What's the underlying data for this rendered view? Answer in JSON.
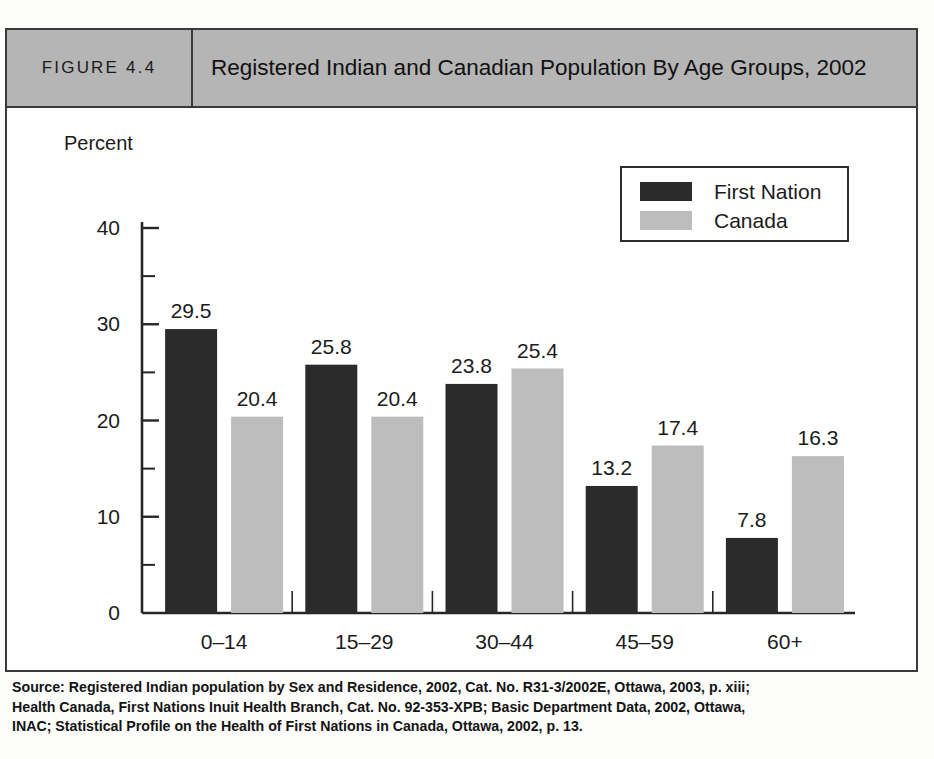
{
  "figure": {
    "number_label": "FIGURE 4.4",
    "title": "Registered Indian and Canadian Population By Age Groups, 2002"
  },
  "legend": {
    "items": [
      {
        "label": "First Nation",
        "color": "#2b2b2b",
        "swatch_name": "legend-swatch-first-nation"
      },
      {
        "label": "Canada",
        "color": "#bdbdbd",
        "swatch_name": "legend-swatch-canada"
      }
    ]
  },
  "axes": {
    "y_unit_label": "Percent",
    "x_title": "Age Group",
    "y_ticks": [
      "0",
      "10",
      "20",
      "30",
      "40"
    ],
    "y_minor_ticks": [
      "5",
      "15",
      "25",
      "35"
    ]
  },
  "source": {
    "line1": "Source: Registered Indian population by Sex and Residence, 2002, Cat. No. R31-3/2002E, Ottawa, 2003, p. xiii;",
    "line2": "Health Canada, First Nations Inuit Health Branch, Cat. No. 92-353-XPB; Basic Department Data, 2002, Ottawa,",
    "line3": "INAC; Statistical Profile on the Health of First Nations in Canada, Ottawa, 2002, p. 13."
  },
  "chart_data": {
    "type": "bar",
    "title": "Registered Indian and Canadian Population By Age Groups, 2002",
    "xlabel": "Age Group",
    "ylabel": "Percent",
    "ylim": [
      0,
      40
    ],
    "ytick_interval": 10,
    "yminor_tick_interval": 5,
    "grid": false,
    "legend_position": "top-right",
    "categories": [
      "0–14",
      "15–29",
      "30–44",
      "45–59",
      "60+"
    ],
    "series": [
      {
        "name": "First Nation",
        "color": "#2b2b2b",
        "values": [
          29.5,
          25.8,
          23.8,
          13.2,
          7.8
        ]
      },
      {
        "name": "Canada",
        "color": "#bdbdbd",
        "values": [
          20.4,
          20.4,
          25.4,
          17.4,
          16.3
        ]
      }
    ]
  }
}
